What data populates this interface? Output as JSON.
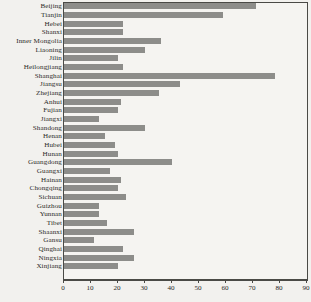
{
  "chart_data": {
    "type": "bar",
    "orientation": "horizontal",
    "title": "",
    "xlabel": "",
    "ylabel": "",
    "xlim": [
      0,
      90
    ],
    "ylim": null,
    "grid": false,
    "legend": null,
    "bar_color": "#8d8d8a",
    "frame_color": "#4a4a46",
    "background_color": "#f2f1ee",
    "xticks": [
      0,
      10,
      20,
      30,
      40,
      50,
      60,
      70,
      80,
      90
    ],
    "xtick_labels": [
      "0",
      "10",
      "20",
      "30",
      "40",
      "50",
      "60",
      "70",
      "80",
      "90"
    ],
    "categories": [
      "Beijing",
      "Tianjin",
      "Hebei",
      "Shanxi",
      "Inner Mongolia",
      "Liaoning",
      "Jilin",
      "Heilongjiang",
      "Shanghai",
      "Jiangsu",
      "Zhejiang",
      "Anhui",
      "Fujian",
      "Jiangxi",
      "Shandong",
      "Henan",
      "Hubei",
      "Hunan",
      "Guangdong",
      "Guangxi",
      "Hainan",
      "Chongqing",
      "Sichuan",
      "Guizhou",
      "Yunnan",
      "Tibet",
      "Shaanxi",
      "Gansu",
      "Qinghai",
      "Ningxia",
      "Xinjiang"
    ],
    "values": [
      71,
      59,
      22,
      22,
      36,
      30,
      20,
      22,
      78,
      43,
      35,
      21,
      20,
      13,
      30,
      15,
      19,
      20,
      40,
      17,
      21,
      20,
      23,
      13,
      13,
      16,
      26,
      11,
      22,
      26,
      20
    ]
  }
}
